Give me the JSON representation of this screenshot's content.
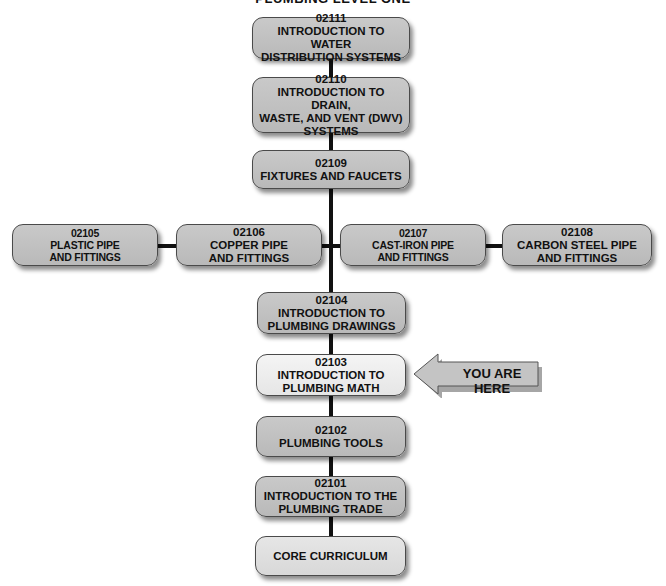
{
  "title": "PLUMBING LEVEL ONE",
  "modules": [
    {
      "code": "02111",
      "lines": [
        "INTRODUCTION TO WATER",
        "DISTRIBUTION SYSTEMS"
      ]
    },
    {
      "code": "02110",
      "lines": [
        "INTRODUCTION TO DRAIN,",
        "WASTE, AND VENT (DWV)",
        "SYSTEMS"
      ]
    },
    {
      "code": "02109",
      "lines": [
        "FIXTURES AND FAUCETS"
      ]
    },
    {
      "code": "02105",
      "lines": [
        "PLASTIC PIPE",
        "AND FITTINGS"
      ]
    },
    {
      "code": "02106",
      "lines": [
        "COPPER PIPE",
        "AND FITTINGS"
      ]
    },
    {
      "code": "02107",
      "lines": [
        "CAST-IRON PIPE",
        "AND FITTINGS"
      ]
    },
    {
      "code": "02108",
      "lines": [
        "CARBON STEEL PIPE",
        "AND FITTINGS"
      ]
    },
    {
      "code": "02104",
      "lines": [
        "INTRODUCTION TO",
        "PLUMBING DRAWINGS"
      ]
    },
    {
      "code": "02103",
      "lines": [
        "INTRODUCTION TO",
        "PLUMBING MATH"
      ],
      "highlighted": true
    },
    {
      "code": "02102",
      "lines": [
        "PLUMBING TOOLS"
      ]
    },
    {
      "code": "02101",
      "lines": [
        "INTRODUCTION TO THE",
        "PLUMBING TRADE"
      ]
    },
    {
      "code": "",
      "lines": [
        "CORE CURRICULUM"
      ]
    }
  ],
  "marker": {
    "label": "YOU ARE HERE",
    "points_to": "02103"
  },
  "colors": {
    "box": "#bdbdbd",
    "highlight": "#ececec",
    "core": "#dedede",
    "connector": "#111111"
  }
}
